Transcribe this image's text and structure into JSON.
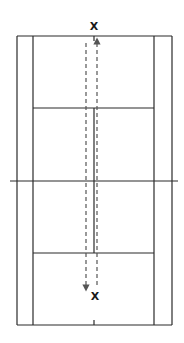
{
  "diagram": {
    "type": "badminton-court-drill",
    "colors": {
      "background": "#ffffff",
      "court_line": "#2b2b2b",
      "path_line": "#555555",
      "marker": "#1a1a1a"
    },
    "court": {
      "outer": {
        "x1": 17,
        "y1": 36,
        "x2": 172,
        "y2": 325
      },
      "inner_side_lines": {
        "left_x": 33,
        "right_x": 154
      },
      "net": {
        "y": 181,
        "x1": 10,
        "x2": 178
      },
      "short_service_lines": {
        "top_y": 108,
        "bottom_y": 253
      },
      "center_line_x": 94
    },
    "markers": [
      {
        "label": "X",
        "x": 94,
        "y": 26,
        "position": "top"
      },
      {
        "label": "X",
        "x": 95,
        "y": 296,
        "position": "bottom"
      }
    ],
    "paths": [
      {
        "name": "down-path",
        "x": 86,
        "y_start": 43,
        "y_end": 288,
        "direction": "down",
        "style": "dashed"
      },
      {
        "name": "up-path",
        "x": 97,
        "y_start": 285,
        "y_end": 41,
        "direction": "up",
        "style": "dashed"
      }
    ]
  }
}
